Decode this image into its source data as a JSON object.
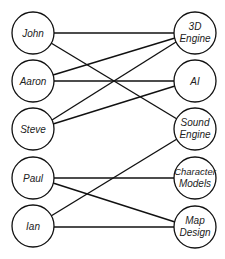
{
  "diagram": {
    "type": "bipartite-graph",
    "colors": {
      "stroke": "#111111",
      "fill": "#ffffff",
      "text": "#222222"
    },
    "left_nodes": [
      {
        "id": "john",
        "label": "John",
        "cx": 33,
        "cy": 33
      },
      {
        "id": "aaron",
        "label": "Aaron",
        "cx": 33,
        "cy": 81
      },
      {
        "id": "steve",
        "label": "Steve",
        "cx": 33,
        "cy": 129
      },
      {
        "id": "paul",
        "label": "Paul",
        "cx": 33,
        "cy": 178
      },
      {
        "id": "ian",
        "label": "Ian",
        "cx": 33,
        "cy": 226
      }
    ],
    "right_nodes": [
      {
        "id": "3d-engine",
        "label_line1": "3D",
        "label_line2": "Engine",
        "cx": 195,
        "cy": 33
      },
      {
        "id": "ai",
        "label_line1": "AI",
        "label_line2": "",
        "cx": 195,
        "cy": 81
      },
      {
        "id": "sound-engine",
        "label_line1": "Sound",
        "label_line2": "Engine",
        "cx": 195,
        "cy": 129
      },
      {
        "id": "character-models",
        "label_line1": "Character",
        "label_line2": "Models",
        "cx": 195,
        "cy": 178
      },
      {
        "id": "map-design",
        "label_line1": "Map",
        "label_line2": "Design",
        "cx": 195,
        "cy": 227
      }
    ],
    "edges": [
      {
        "from": "john",
        "to": "3d-engine"
      },
      {
        "from": "john",
        "to": "sound-engine"
      },
      {
        "from": "aaron",
        "to": "3d-engine"
      },
      {
        "from": "aaron",
        "to": "ai"
      },
      {
        "from": "steve",
        "to": "3d-engine"
      },
      {
        "from": "steve",
        "to": "ai"
      },
      {
        "from": "paul",
        "to": "character-models"
      },
      {
        "from": "paul",
        "to": "map-design"
      },
      {
        "from": "ian",
        "to": "sound-engine"
      },
      {
        "from": "ian",
        "to": "map-design"
      }
    ]
  }
}
